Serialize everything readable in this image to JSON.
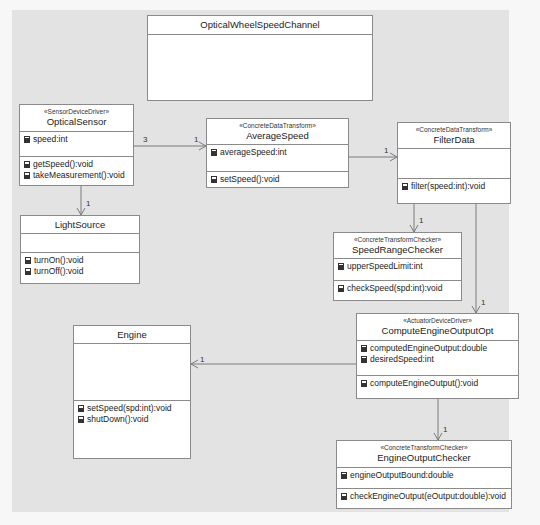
{
  "diagram": {
    "type": "UML class diagram",
    "background_color": "#e3e3e3",
    "box_fill": "#ffffff",
    "line_color": "#8a8a8a"
  },
  "classes": {
    "channel": {
      "name": "OpticalWheelSpeedChannel",
      "stereotype": "",
      "attributes": [],
      "operations": []
    },
    "optical_sensor": {
      "stereotype": "«SensorDeviceDriver»",
      "name": "OpticalSensor",
      "attributes": [
        "speed:int"
      ],
      "operations": [
        "getSpeed():void",
        "takeMeasurement():void"
      ]
    },
    "average_speed": {
      "stereotype": "«ConcreteDataTransform»",
      "name": "AverageSpeed",
      "attributes": [
        "averageSpeed:int"
      ],
      "operations": [
        "setSpeed():void"
      ]
    },
    "filter_data": {
      "stereotype": "«ConcreteDataTransform»",
      "name": "FilterData",
      "attributes": [],
      "operations": [
        "filter(speed:int):void"
      ]
    },
    "light_source": {
      "stereotype": "",
      "name": "LightSource",
      "attributes": [],
      "operations": [
        "turnOn():void",
        "turnOff():void"
      ]
    },
    "speed_range_checker": {
      "stereotype": "«ConcreteTransformChecker»",
      "name": "SpeedRangeChecker",
      "attributes": [
        "upperSpeedLimit:int"
      ],
      "operations": [
        "checkSpeed(spd:int):void"
      ]
    },
    "engine": {
      "stereotype": "",
      "name": "Engine",
      "attributes": [],
      "operations": [
        "setSpeed(spd:int):void",
        "shutDown():void"
      ]
    },
    "compute_engine_output": {
      "stereotype": "«ActuatorDeviceDriver»",
      "name": "ComputeEngineOutputOpt",
      "attributes": [
        "computedEngineOutput:double",
        "desiredSpeed:int"
      ],
      "operations": [
        "computeEngineOutput():void"
      ]
    },
    "engine_output_checker": {
      "stereotype": "«ConcreteTransformChecker»",
      "name": "EngineOutputChecker",
      "attributes": [
        "engineOutputBound:double"
      ],
      "operations": [
        "checkEngineOutput(eOutput:double):void"
      ]
    }
  },
  "associations": [
    {
      "from": "OpticalSensor",
      "to": "AverageSpeed",
      "source_multiplicity": "3",
      "target_multiplicity": "1"
    },
    {
      "from": "AverageSpeed",
      "to": "FilterData",
      "source_multiplicity": "",
      "target_multiplicity": "1"
    },
    {
      "from": "OpticalSensor",
      "to": "LightSource",
      "source_multiplicity": "",
      "target_multiplicity": "1"
    },
    {
      "from": "FilterData",
      "to": "SpeedRangeChecker",
      "source_multiplicity": "",
      "target_multiplicity": "1"
    },
    {
      "from": "FilterData",
      "to": "ComputeEngineOutputOpt",
      "source_multiplicity": "",
      "target_multiplicity": "1"
    },
    {
      "from": "ComputeEngineOutputOpt",
      "to": "Engine",
      "source_multiplicity": "",
      "target_multiplicity": "1"
    },
    {
      "from": "ComputeEngineOutputOpt",
      "to": "EngineOutputChecker",
      "source_multiplicity": "",
      "target_multiplicity": "1"
    }
  ],
  "multiplicities": {
    "sensor_to_avg_src": "3",
    "sensor_to_avg_tgt": "1",
    "avg_to_filter_tgt": "1",
    "sensor_to_light_tgt": "1",
    "filter_to_range_tgt": "1",
    "filter_to_compute_tgt": "1",
    "compute_to_engine_tgt": "1",
    "compute_to_checker_tgt": "1"
  },
  "icons": {
    "attribute": "attribute-icon",
    "operation": "operation-icon"
  }
}
